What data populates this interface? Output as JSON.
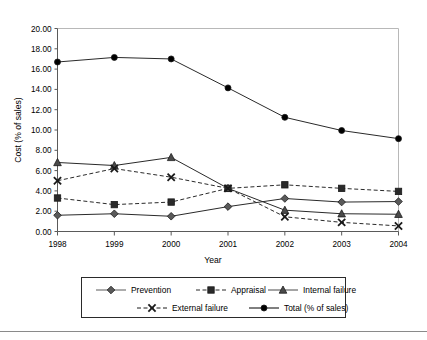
{
  "chart_data": {
    "type": "line",
    "title": "",
    "xlabel": "Year",
    "ylabel": "Cost (% of sales)",
    "categories": [
      "1998",
      "1999",
      "2000",
      "2001",
      "2002",
      "2003",
      "2004"
    ],
    "x": [
      1998,
      1999,
      2000,
      2001,
      2002,
      2003,
      2004
    ],
    "ylim": [
      0.0,
      20.0
    ],
    "ytick_step": 2.0,
    "ytick_labels": [
      "0.00",
      "2.00",
      "4.00",
      "6.00",
      "8.00",
      "10.00",
      "12.00",
      "14.00",
      "16.00",
      "18.00",
      "20.00"
    ],
    "ytick_values": [
      0.0,
      2.0,
      4.0,
      6.0,
      8.0,
      10.0,
      12.0,
      14.0,
      16.0,
      18.0,
      20.0
    ],
    "grid": false,
    "legend_position": "bottom",
    "series": [
      {
        "name": "Prevention",
        "marker": "diamond",
        "linestyle": "solid",
        "color": "#5a5a5a",
        "values": [
          1.6,
          1.75,
          1.5,
          2.45,
          3.25,
          2.9,
          2.95
        ]
      },
      {
        "name": "Appraisal",
        "marker": "square",
        "linestyle": "dashed",
        "color": "#2a2a2a",
        "values": [
          3.3,
          2.65,
          2.9,
          4.25,
          4.6,
          4.25,
          3.95
        ]
      },
      {
        "name": "Internal failure",
        "marker": "triangle",
        "linestyle": "solid",
        "color": "#4a4a4a",
        "values": [
          6.8,
          6.5,
          7.3,
          4.25,
          2.1,
          1.75,
          1.7
        ]
      },
      {
        "name": "External failure",
        "marker": "cross",
        "linestyle": "dashed",
        "color": "#1a1a1a",
        "values": [
          5.0,
          6.2,
          5.35,
          4.25,
          1.45,
          0.9,
          0.55
        ]
      },
      {
        "name": "Total (% of sales)",
        "marker": "circle",
        "linestyle": "solid",
        "color": "#000000",
        "values": [
          16.7,
          17.15,
          17.0,
          14.15,
          11.25,
          9.95,
          9.15
        ]
      }
    ]
  },
  "legend": {
    "items": [
      {
        "label": "Prevention"
      },
      {
        "label": "Appraisal"
      },
      {
        "label": "Internal failure"
      },
      {
        "label": "External failure"
      },
      {
        "label": "Total (% of sales)"
      }
    ]
  }
}
